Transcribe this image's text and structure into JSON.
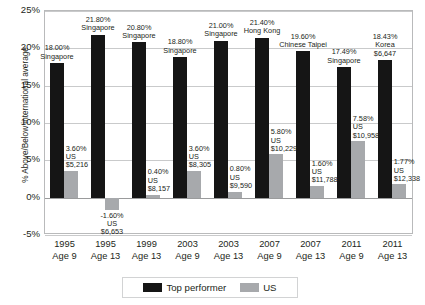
{
  "chart_data": {
    "type": "bar",
    "title": "",
    "xlabel": "",
    "ylabel": "% Above/Below international average",
    "ylim": [
      -5,
      25
    ],
    "ytick_labels": [
      "25%",
      "20%",
      "15%",
      "10%",
      "5%",
      "0%",
      "-5%"
    ],
    "ytick_values": [
      25,
      20,
      15,
      10,
      5,
      0,
      -5
    ],
    "grid": true,
    "legend_position": "bottom",
    "categories": [
      "1995\nAge 9",
      "1995\nAge 13",
      "1999\nAge 13",
      "2003\nAge 9",
      "2003\nAge 13",
      "2007\nAge 9",
      "2007\nAge 13",
      "2011\nAge 9",
      "2011\nAge 13"
    ],
    "category_years": [
      "1995",
      "1995",
      "1999",
      "2003",
      "2003",
      "2007",
      "2007",
      "2011",
      "2011"
    ],
    "category_ages": [
      "Age 9",
      "Age 13",
      "Age 13",
      "Age 9",
      "Age 13",
      "Age 9",
      "Age 13",
      "Age 9",
      "Age 13"
    ],
    "series": [
      {
        "name": "Top performer",
        "color": "#151515",
        "values": [
          18.0,
          21.8,
          20.8,
          18.8,
          21.0,
          21.4,
          19.6,
          17.49,
          18.43
        ],
        "labels": [
          {
            "pct": "18.00%",
            "country": "Singapore",
            "spend": ""
          },
          {
            "pct": "21.80%",
            "country": "Singapore",
            "spend": ""
          },
          {
            "pct": "20.80%",
            "country": "Singapore",
            "spend": ""
          },
          {
            "pct": "18.80%",
            "country": "Singapore",
            "spend": ""
          },
          {
            "pct": "21.00%",
            "country": "Singapore",
            "spend": ""
          },
          {
            "pct": "21.40%",
            "country": "Hong Kong",
            "spend": ""
          },
          {
            "pct": "19.60%",
            "country": "Chinese Taipei",
            "spend": ""
          },
          {
            "pct": "17.49%",
            "country": "Singapore",
            "spend": ""
          },
          {
            "pct": "18.43%",
            "country": "Korea",
            "spend": "$6,647"
          }
        ]
      },
      {
        "name": "US",
        "color": "#a7a9ac",
        "values": [
          3.6,
          -1.6,
          0.4,
          3.6,
          0.8,
          5.8,
          1.6,
          7.58,
          1.77
        ],
        "labels": [
          {
            "pct": "3.60%",
            "country": "US",
            "spend": "$5,216"
          },
          {
            "pct": "-1.60%",
            "country": "US",
            "spend": "$6,653"
          },
          {
            "pct": "0.40%",
            "country": "US",
            "spend": "$8,157"
          },
          {
            "pct": "3.60%",
            "country": "US",
            "spend": "$8,305"
          },
          {
            "pct": "0.80%",
            "country": "US",
            "spend": "$9,590"
          },
          {
            "pct": "5.80%",
            "country": "US",
            "spend": "$10,229"
          },
          {
            "pct": "1.60%",
            "country": "US",
            "spend": "$11,788"
          },
          {
            "pct": "7.58%",
            "country": "US",
            "spend": "$10,958"
          },
          {
            "pct": "1.77%",
            "country": "US",
            "spend": "$12,338"
          }
        ]
      }
    ]
  },
  "legend": {
    "entries": [
      {
        "label": "Top performer",
        "color": "#151515"
      },
      {
        "label": "US",
        "color": "#a7a9ac"
      }
    ]
  }
}
